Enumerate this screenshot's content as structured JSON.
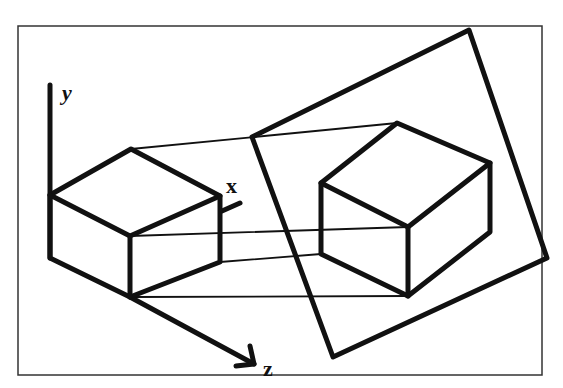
{
  "diagram": {
    "axes": {
      "y_label": "y",
      "x_label": "x",
      "z_label": "z"
    },
    "frame": {
      "x": 18,
      "y": 26,
      "w": 524,
      "h": 349
    },
    "left_cube": {
      "top": [
        131,
        149
      ],
      "left": [
        50,
        195
      ],
      "right": [
        220,
        196
      ],
      "front_top": [
        130,
        236
      ],
      "front_bottom": [
        130,
        297
      ],
      "left_bottom": [
        50,
        258
      ],
      "right_bottom": [
        220,
        262
      ]
    },
    "projection_plane": [
      [
        252,
        137
      ],
      [
        469,
        30
      ],
      [
        547,
        258
      ],
      [
        333,
        357
      ]
    ],
    "right_cube": {
      "top": [
        397,
        123
      ],
      "left": [
        321,
        183
      ],
      "right": [
        490,
        163
      ],
      "front_top": [
        408,
        227
      ],
      "front_bottom": [
        408,
        296
      ],
      "left_bottom": [
        321,
        254
      ],
      "right_bottom": [
        490,
        232
      ]
    },
    "projectors": "parallel lines connecting corresponding vertices of the object and its projection"
  }
}
